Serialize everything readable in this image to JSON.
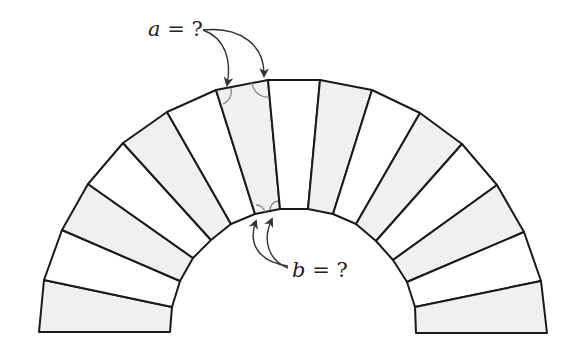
{
  "diagram": {
    "labels": {
      "a": {
        "var": "a",
        "text": " = ?"
      },
      "b": {
        "var": "b",
        "text": " = ?"
      }
    },
    "colors": {
      "stroke": "#1a1a1a",
      "shaded": "#f0f0f0",
      "unshaded": "#ffffff",
      "angle_arc": "#8a8a8a",
      "arrow": "#333333"
    },
    "outer_points": [
      [
        39,
        332
      ],
      [
        44,
        280
      ],
      [
        62,
        230
      ],
      [
        88,
        184
      ],
      [
        123,
        143
      ],
      [
        167,
        112
      ],
      [
        216,
        90
      ],
      [
        268,
        80
      ],
      [
        320,
        80
      ],
      [
        372,
        90
      ],
      [
        420,
        113
      ],
      [
        462,
        144
      ],
      [
        497,
        185
      ],
      [
        524,
        232
      ],
      [
        541,
        281
      ],
      [
        547,
        333
      ]
    ],
    "inner_points": [
      [
        170,
        332
      ],
      [
        172,
        307
      ],
      [
        180,
        281
      ],
      [
        193,
        258
      ],
      [
        211,
        240
      ],
      [
        231,
        224
      ],
      [
        255,
        214
      ],
      [
        280,
        209
      ],
      [
        308,
        209
      ],
      [
        333,
        214
      ],
      [
        356,
        224
      ],
      [
        376,
        241
      ],
      [
        393,
        260
      ],
      [
        407,
        282
      ],
      [
        415,
        307
      ],
      [
        416,
        333
      ]
    ],
    "block_count": 15,
    "shading": [
      "gray",
      "white",
      "gray",
      "white",
      "gray",
      "white",
      "gray",
      "white",
      "gray",
      "white",
      "gray",
      "white",
      "gray",
      "white",
      "gray"
    ],
    "highlighted_block_index": 6
  }
}
